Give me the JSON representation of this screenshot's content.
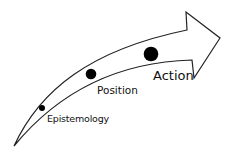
{
  "diagram": {
    "type": "curved-arrow-progression",
    "stages": [
      {
        "label": "Epistemology",
        "dot_size": "small"
      },
      {
        "label": "Position",
        "dot_size": "medium"
      },
      {
        "label": "Action",
        "dot_size": "large"
      }
    ],
    "colors": {
      "stroke": "#222222",
      "dot": "#000000",
      "background": "#ffffff"
    }
  }
}
